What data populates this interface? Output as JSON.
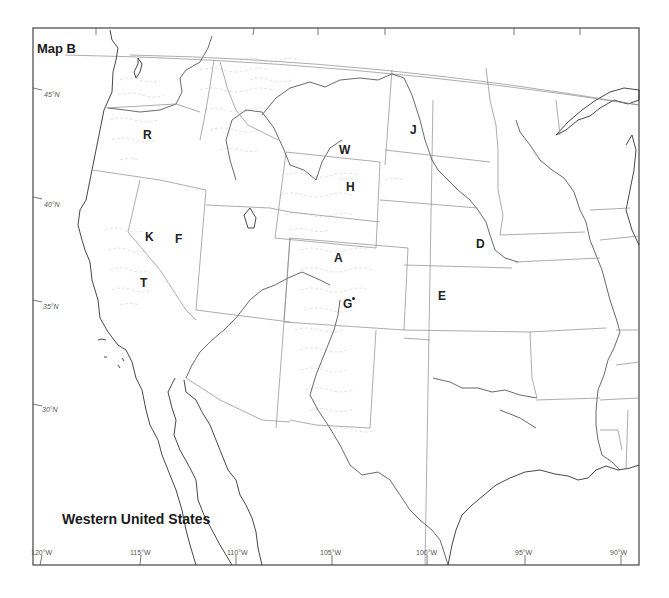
{
  "map": {
    "title": "Map B",
    "subtitle": "Western United States",
    "colors": {
      "background": "#ffffff",
      "boundary": "#8a8a8a",
      "coastline": "#333333",
      "mountain_hatching": "#c4c4c4",
      "text": "#222222"
    },
    "latitude_labels": [
      {
        "label": "45°N"
      },
      {
        "label": "40°N"
      },
      {
        "label": "35°N"
      },
      {
        "label": "30°N"
      }
    ],
    "longitude_labels": [
      {
        "label": "120°W"
      },
      {
        "label": "115°W"
      },
      {
        "label": "110°W"
      },
      {
        "label": "105°W"
      },
      {
        "label": "100°W"
      },
      {
        "label": "95°W"
      },
      {
        "label": "90°W"
      }
    ],
    "point_labels": [
      {
        "id": "R",
        "label": "R"
      },
      {
        "id": "W",
        "label": "W"
      },
      {
        "id": "J",
        "label": "J"
      },
      {
        "id": "H",
        "label": "H"
      },
      {
        "id": "K",
        "label": "K"
      },
      {
        "id": "F",
        "label": "F"
      },
      {
        "id": "A",
        "label": "A"
      },
      {
        "id": "D",
        "label": "D"
      },
      {
        "id": "T",
        "label": "T"
      },
      {
        "id": "G",
        "label": "G"
      },
      {
        "id": "E",
        "label": "E"
      }
    ]
  }
}
